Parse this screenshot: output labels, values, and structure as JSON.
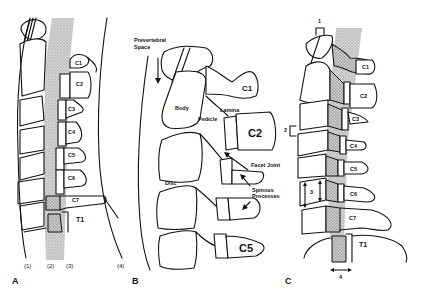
{
  "figure": {
    "panels": [
      {
        "id": "A",
        "label": "A",
        "vertebrae": [
          "C1",
          "C2",
          "C3",
          "C4",
          "C5",
          "C6",
          "C7",
          "T1"
        ],
        "lines": [
          "(1)",
          "(2)",
          "(3)",
          "(4)"
        ]
      },
      {
        "id": "B",
        "label": "B",
        "vertebrae": [
          "C1",
          "C2",
          "C5"
        ],
        "annotations": {
          "prevertebral_space": "Prevertebral\nSpace",
          "prevertebral_line1": "Prevertebral",
          "prevertebral_line2": "Space",
          "body": "Body",
          "lamina": "Lamina",
          "pedicle": "Pedicle",
          "facet_joint": "Facet Joint",
          "disc": "Disc",
          "spinous_line1": "Spinous",
          "spinous_line2": "Processes"
        }
      },
      {
        "id": "C",
        "label": "C",
        "vertebrae": [
          "C1",
          "C2",
          "C3",
          "C4",
          "C5",
          "C6",
          "C7",
          "T1"
        ],
        "measurements": [
          "1",
          "2",
          "3",
          "4"
        ]
      }
    ]
  }
}
